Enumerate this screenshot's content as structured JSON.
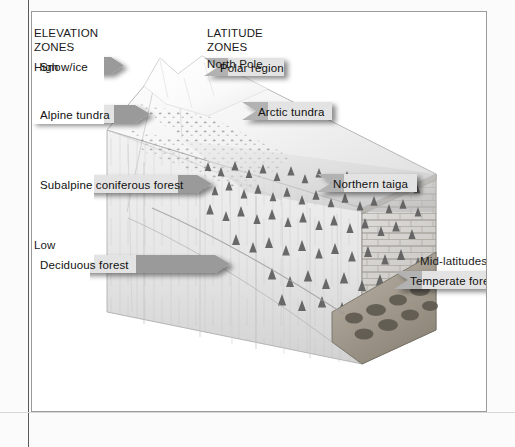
{
  "figure": {
    "background_color": "#ffffff",
    "frame_color": "#5b5b5b",
    "tag_fill_dark": "#8c8c8c",
    "tag_fill_light": "#e8e8e8",
    "text_color": "#1a1a1a"
  },
  "elevation_column": {
    "heading_line1": "ELEVATION",
    "heading_line2": "ZONES",
    "extreme_high": "High",
    "extreme_low": "Low",
    "zones": [
      {
        "label": "Snow/ice",
        "direction": "point-right"
      },
      {
        "label": "Alpine tundra",
        "direction": "point-right"
      },
      {
        "label": "Subalpine coniferous forest",
        "direction": "point-right"
      },
      {
        "label": "Deciduous forest",
        "direction": "point-right"
      }
    ]
  },
  "latitude_column": {
    "heading_line1": "LATITUDE",
    "heading_line2": "ZONES",
    "extreme_high": "North Pole",
    "extreme_low": "Mid-latitudes",
    "zones": [
      {
        "label": "Polar region",
        "direction": "point-left"
      },
      {
        "label": "Arctic tundra",
        "direction": "point-left"
      },
      {
        "label": "Northern taiga",
        "direction": "point-left"
      },
      {
        "label": "Temperate forest",
        "direction": "point-left"
      }
    ]
  },
  "artwork": {
    "description": "Three-dimensional cutaway block diagram of a mountain ridge descending from a snow-capped peak at upper left to a forested lowland at lower right, resting on a rocky stone base.",
    "features": [
      "snow-capped-peak",
      "alpine-tundra-shrubs",
      "coniferous-forest-slope",
      "deciduous-lowland",
      "stone-block-base"
    ]
  }
}
